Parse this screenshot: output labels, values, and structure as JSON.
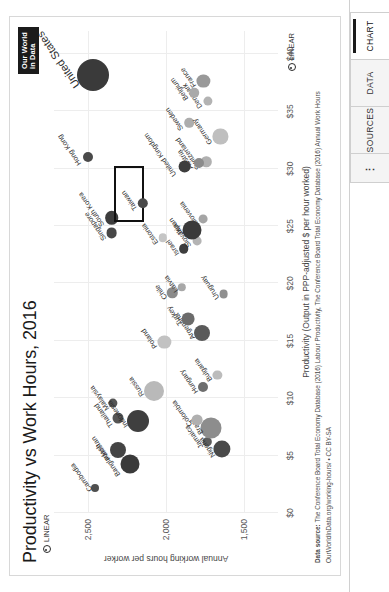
{
  "window": {
    "tabs": [
      {
        "label": "CHART",
        "active": true
      },
      {
        "label": "DATA",
        "active": false
      },
      {
        "label": "SOURCES",
        "active": false
      }
    ],
    "menu_label": "⋮"
  },
  "logo": {
    "line1": "Our World",
    "line2": "in Data"
  },
  "footer": {
    "source_prefix": "Data source:",
    "source_text": " The Conference Board Total Economy Database (2016) Labour Productivity, The Conference Board Total Economy Database (2016) Annual Work Hours",
    "license": "OurWorldInData.org/working-hours/ • CC BY-SA"
  },
  "controls": {
    "linear_x": "LINEAR",
    "linear_y": "LINEAR"
  },
  "chart_data": {
    "type": "scatter",
    "title": "Productivity vs Work Hours, 2016",
    "xlabel": "Productivity (Output in PPP-adjusted $ per hour worked)",
    "ylabel": "Annual working hours per worker",
    "xlim": [
      0,
      42
    ],
    "ylim": [
      1280,
      2720
    ],
    "xticks": [
      "$0",
      "$5",
      "$10",
      "$15",
      "$20",
      "$25",
      "$30",
      "$35",
      "$40"
    ],
    "xtick_values": [
      0,
      5,
      10,
      15,
      20,
      25,
      30,
      35,
      40
    ],
    "yticks": [
      "1,500",
      "2,000",
      "2,500"
    ],
    "ytick_values": [
      1500,
      2000,
      2500
    ],
    "grid": true,
    "legend": "none",
    "highlight": "Taiwan",
    "size_encodes": "population",
    "points": [
      {
        "name": "Cambodia",
        "x": 2.2,
        "y": 2456,
        "r": 4.0,
        "c": "#4f4f4f",
        "lx": -3,
        "ly": -9,
        "rot": -35
      },
      {
        "name": "Bangladesh",
        "x": 4.3,
        "y": 2232,
        "r": 9.5,
        "c": "#3a3a3a",
        "lx": -12,
        "ly": -16,
        "rot": -35
      },
      {
        "name": "Pakistan",
        "x": 5.5,
        "y": 2310,
        "r": 8.0,
        "c": "#444444",
        "lx": -10,
        "ly": -14,
        "rot": -35
      },
      {
        "name": "Thailand",
        "x": 8.3,
        "y": 2310,
        "r": 5.5,
        "c": "#555555",
        "lx": -9,
        "ly": -11,
        "rot": -35
      },
      {
        "name": "Malaysia",
        "x": 9.6,
        "y": 2340,
        "r": 4.6,
        "c": "#555555",
        "lx": -7,
        "ly": -10,
        "rot": -35
      },
      {
        "name": "Indonesia",
        "x": 8.0,
        "y": 2180,
        "r": 11.0,
        "c": "#3f3f3f",
        "lx": -6,
        "ly": -16,
        "rot": -35
      },
      {
        "name": "Russia",
        "x": 10.6,
        "y": 2078,
        "r": 10.0,
        "c": "#b9b9b9",
        "lx": -5,
        "ly": -16,
        "rot": -35
      },
      {
        "name": "Jamaica",
        "x": 6.2,
        "y": 1735,
        "r": 4.2,
        "c": "#5c5c5c",
        "lx": -6,
        "ly": -10,
        "rot": -35
      },
      {
        "name": "Nigeria",
        "x": 5.6,
        "y": 1640,
        "r": 8.6,
        "c": "#4a4a4a",
        "lx": -8,
        "ly": -13,
        "rot": -35
      },
      {
        "name": "Brazil",
        "x": 7.4,
        "y": 1710,
        "r": 10.5,
        "c": "#8d8d8d",
        "lx": -6,
        "ly": -14,
        "rot": -35
      },
      {
        "name": "Colombia",
        "x": 8.1,
        "y": 1800,
        "r": 5.4,
        "c": "#b0b0b0",
        "lx": -6,
        "ly": -11,
        "rot": -35
      },
      {
        "name": "Hungary",
        "x": 11.0,
        "y": 1760,
        "r": 5.0,
        "c": "#6e6e6e",
        "lx": -6,
        "ly": -11,
        "rot": -35
      },
      {
        "name": "Bulgaria",
        "x": 12.0,
        "y": 1670,
        "r": 4.6,
        "c": "#bcbcbc",
        "lx": -6,
        "ly": -11,
        "rot": -35
      },
      {
        "name": "Poland",
        "x": 14.9,
        "y": 2010,
        "r": 6.6,
        "c": "#c2c2c2",
        "lx": -6,
        "ly": -13,
        "rot": -35
      },
      {
        "name": "Argentina",
        "x": 15.7,
        "y": 1770,
        "r": 8.0,
        "c": "#5a5a5a",
        "lx": -6,
        "ly": -13,
        "rot": -35
      },
      {
        "name": "Turkey",
        "x": 16.9,
        "y": 1860,
        "r": 6.4,
        "c": "#6b6b6b",
        "lx": -6,
        "ly": -12,
        "rot": -35
      },
      {
        "name": "Chile",
        "x": 19.2,
        "y": 1960,
        "r": 5.2,
        "c": "#8a8a8a",
        "lx": -6,
        "ly": -11,
        "rot": -35
      },
      {
        "name": "Latvia",
        "x": 19.7,
        "y": 1900,
        "r": 4.2,
        "c": "#a8a8a8",
        "lx": -5,
        "ly": -10,
        "rot": -35
      },
      {
        "name": "Uruguay",
        "x": 19.1,
        "y": 1630,
        "r": 4.4,
        "c": "#8f8f8f",
        "lx": -5,
        "ly": -11,
        "rot": -35
      },
      {
        "name": "Israel",
        "x": 23.0,
        "y": 1885,
        "r": 4.8,
        "c": "#3d3d3d",
        "lx": -6,
        "ly": -11,
        "rot": -35
      },
      {
        "name": "Slovakia",
        "x": 23.7,
        "y": 1800,
        "r": 4.4,
        "c": "#b4b4b4",
        "lx": -6,
        "ly": -12,
        "rot": -35
      },
      {
        "name": "Slovenia",
        "x": 25.6,
        "y": 1760,
        "r": 4.4,
        "c": "#a5a5a5",
        "lx": -6,
        "ly": -11,
        "rot": -35
      },
      {
        "name": "Japan",
        "x": 24.7,
        "y": 1835,
        "r": 9.5,
        "c": "#3a3a3a",
        "lx": -5,
        "ly": -15,
        "rot": -35
      },
      {
        "name": "Estonia",
        "x": 24.0,
        "y": 2020,
        "r": 4.2,
        "c": "#c5c5c5",
        "lx": -6,
        "ly": -11,
        "rot": -35
      },
      {
        "name": "Singapore",
        "x": 24.4,
        "y": 2350,
        "r": 5.4,
        "c": "#474747",
        "lx": -7,
        "ly": -12,
        "rot": -35
      },
      {
        "name": "South Korea",
        "x": 25.7,
        "y": 2350,
        "r": 6.8,
        "c": "#3d3d3d",
        "lx": -8,
        "ly": -14,
        "rot": -35
      },
      {
        "name": "Taiwan",
        "x": 27.0,
        "y": 2150,
        "r": 5.2,
        "c": "#4a4a4a",
        "lx": -7,
        "ly": -12,
        "rot": -35
      },
      {
        "name": "Hong Kong",
        "x": 31.0,
        "y": 2500,
        "r": 5.0,
        "c": "#4a4a4a",
        "lx": -8,
        "ly": -13,
        "rot": -35
      },
      {
        "name": "Switzerland",
        "x": 30.6,
        "y": 1740,
        "r": 5.2,
        "c": "#b0b0b0",
        "lx": -7,
        "ly": -12,
        "rot": -35
      },
      {
        "name": "Austria",
        "x": 30.5,
        "y": 1790,
        "r": 5.0,
        "c": "#8b8b8b",
        "lx": -6,
        "ly": -12,
        "rot": -35
      },
      {
        "name": "United Kingdom",
        "x": 30.2,
        "y": 1880,
        "r": 6.4,
        "c": "#3d3d3d",
        "lx": -10,
        "ly": -15,
        "rot": -35
      },
      {
        "name": "Sweden",
        "x": 34.0,
        "y": 1850,
        "r": 4.8,
        "c": "#adadad",
        "lx": -7,
        "ly": -12,
        "rot": -35
      },
      {
        "name": "Germany",
        "x": 32.8,
        "y": 1650,
        "r": 7.6,
        "c": "#bfbfbf",
        "lx": -7,
        "ly": -14,
        "rot": -35
      },
      {
        "name": "Denmark",
        "x": 35.9,
        "y": 1730,
        "r": 4.6,
        "c": "#b3b3b3",
        "lx": -7,
        "ly": -12,
        "rot": -35
      },
      {
        "name": "Belgium",
        "x": 36.6,
        "y": 1820,
        "r": 4.8,
        "c": "#a9a9a9",
        "lx": -7,
        "ly": -12,
        "rot": -35
      },
      {
        "name": "France",
        "x": 37.6,
        "y": 1760,
        "r": 6.6,
        "c": "#999999",
        "lx": -6,
        "ly": -13,
        "rot": -35
      },
      {
        "name": "United States",
        "x": 38.2,
        "y": 2470,
        "r": 16.0,
        "c": "#3a3a3a",
        "lx": -12,
        "ly": -22,
        "rot": -35
      }
    ]
  }
}
